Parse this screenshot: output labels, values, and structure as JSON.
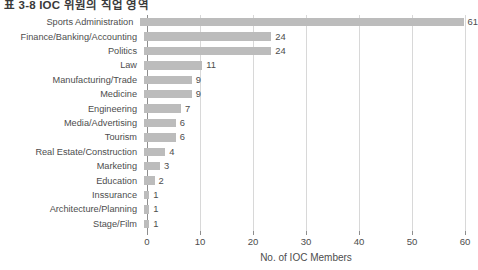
{
  "chart_data": {
    "type": "bar",
    "orientation": "horizontal",
    "title": "표 3-8 IOC 위원의 직업 영역",
    "xlabel": "No. of IOC Members",
    "ylabel": "",
    "xlim": [
      0,
      60
    ],
    "xticks": [
      0,
      10,
      20,
      30,
      40,
      50,
      60
    ],
    "xtick_labels": [
      "0",
      "10",
      "20",
      "30",
      "40",
      "50",
      "60"
    ],
    "grid": true,
    "legend": null,
    "bar_color": "#bcbcbc",
    "categories": [
      "Sports Administration",
      "Finance/Banking/Accounting",
      "Politics",
      "Law",
      "Manufacturing/Trade",
      "Medicine",
      "Engineering",
      "Media/Advertising",
      "Tourism",
      "Real Estate/Construction",
      "Marketing",
      "Education",
      "Inssurance",
      "Architecture/Planning",
      "Stage/Film"
    ],
    "values": [
      61,
      24,
      24,
      11,
      9,
      9,
      7,
      6,
      6,
      4,
      3,
      2,
      1,
      1,
      1
    ],
    "value_labels": [
      "61",
      "24",
      "24",
      "11",
      "9",
      "9",
      "7",
      "6",
      "6",
      "4",
      "3",
      "2",
      "1",
      "1",
      "1"
    ]
  }
}
